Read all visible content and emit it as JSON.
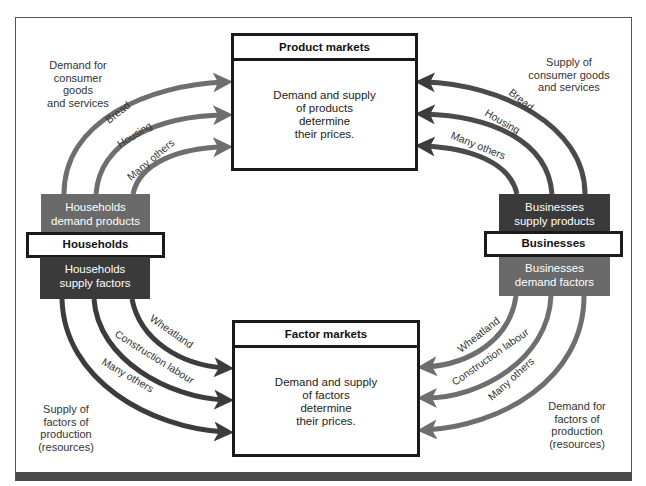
{
  "colors": {
    "arrow_product": "#6e6e6e",
    "arrow_factor": "#3c3c3c",
    "households_demand_bg": "#6a6a6a",
    "households_supply_bg": "#3a3a3a",
    "businesses_supply_bg": "#3a3a3a",
    "businesses_demand_bg": "#6a6a6a",
    "box_border": "#1a1a1a",
    "bottom_bar": "#4a4a4a"
  },
  "product_markets": {
    "title": "Product markets",
    "body": [
      "Demand and supply",
      "of products",
      "determine",
      "their prices."
    ]
  },
  "factor_markets": {
    "title": "Factor markets",
    "body": [
      "Demand and supply",
      "of factors",
      "determine",
      "their prices."
    ]
  },
  "households": {
    "label": "Households",
    "demand": [
      "Households",
      "demand products"
    ],
    "supply": [
      "Households",
      "supply factors"
    ]
  },
  "businesses": {
    "label": "Businesses",
    "supply": [
      "Businesses",
      "supply products"
    ],
    "demand": [
      "Businesses",
      "demand factors"
    ]
  },
  "notes": {
    "top_left": [
      "Demand for",
      "consumer goods",
      "and services"
    ],
    "top_right": [
      "Supply of",
      "consumer goods",
      "and services"
    ],
    "bottom_left": [
      "Supply of",
      "factors of",
      "production",
      "(resources)"
    ],
    "bottom_right": [
      "Demand for",
      "factors of",
      "production",
      "(resources)"
    ]
  },
  "flows": {
    "households_to_product": [
      "Bread",
      "Housing",
      "Many others"
    ],
    "businesses_to_product": [
      "Bread",
      "Housing",
      "Many others"
    ],
    "households_to_factor": [
      "Wheatland",
      "Construction labour",
      "Many others"
    ],
    "businesses_to_factor": [
      "Wheatland",
      "Construction labour",
      "Many others"
    ]
  }
}
